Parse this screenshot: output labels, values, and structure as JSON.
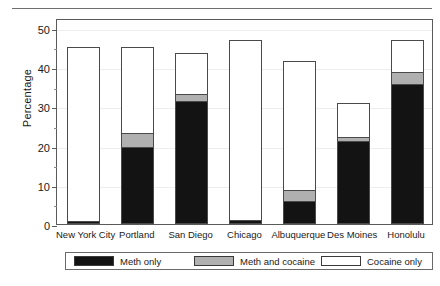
{
  "chart_data": {
    "type": "bar",
    "subtype": "stacked-bar",
    "title": "",
    "xlabel": "",
    "ylabel": "Percentage",
    "ylim": [
      0,
      52.5
    ],
    "yticks": [
      0,
      10,
      20,
      30,
      40,
      50
    ],
    "ytick_labels": [
      "0",
      "10",
      "20",
      "30",
      "40",
      "50"
    ],
    "yminor_ticks": [
      5,
      15,
      25,
      35,
      45
    ],
    "grid": true,
    "grid_axis": "y",
    "legend_position": "bottom",
    "categories": [
      "New York City",
      "Portland",
      "San Diego",
      "Chicago",
      "Albuquerque",
      "Des Moines",
      "Honolulu"
    ],
    "series": [
      {
        "name": "Meth only",
        "color": "#131313",
        "values": [
          0.5,
          19.5,
          31.0,
          0.7,
          5.5,
          21.0,
          35.5
        ]
      },
      {
        "name": "Meth and cocaine",
        "color": "#b0b0b0",
        "values": [
          0.0,
          3.5,
          2.0,
          0.0,
          3.0,
          1.0,
          3.0
        ]
      },
      {
        "name": "Cocaine only",
        "color": "#ffffff",
        "values": [
          44.5,
          22.0,
          10.5,
          46.3,
          33.0,
          8.8,
          8.5
        ]
      }
    ],
    "totals": [
      45.0,
      45.0,
      43.5,
      47.0,
      41.5,
      30.8,
      47.0
    ]
  },
  "legend": {
    "entries": [
      {
        "label": "Meth only",
        "color": "#131313"
      },
      {
        "label": "Meth and cocaine",
        "color": "#b0b0b0"
      },
      {
        "label": "Cocaine only",
        "color": "#ffffff"
      }
    ]
  },
  "axes": {
    "y_title": "Percentage"
  },
  "colors": {
    "meth_only": "#131313",
    "meth_and_cocaine": "#b0b0b0",
    "cocaine_only": "#ffffff",
    "frame": "#5a5a5a",
    "grid": "#ededed"
  }
}
